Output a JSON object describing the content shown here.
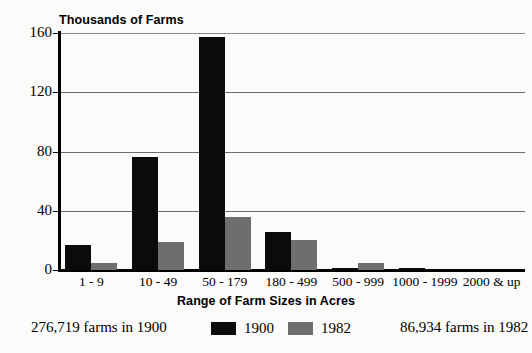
{
  "chart_data": {
    "type": "bar",
    "title": "",
    "ylabel": "Thousands of Farms",
    "xlabel": "Range of Farm Sizes in Acres",
    "categories": [
      "1 - 9",
      "10 - 49",
      "50 - 179",
      "180 - 499",
      "500 - 999",
      "1000 - 1999",
      "2000 & up"
    ],
    "series": [
      {
        "name": "1900",
        "color": "#0b0b0b",
        "values": [
          17,
          76,
          157,
          26,
          1.5,
          1.5,
          0
        ]
      },
      {
        "name": "1982",
        "color": "#6e6e6e",
        "values": [
          5,
          19,
          36,
          20,
          5,
          0,
          0
        ]
      }
    ],
    "ylim": [
      0,
      160
    ],
    "yticks": [
      "0",
      "40",
      "80",
      "120",
      "160"
    ],
    "ytick_values": [
      0,
      40,
      80,
      120,
      160
    ],
    "grid": "horizontal",
    "legend_position": "bottom-center"
  },
  "axes": {
    "y_title": "Thousands of Farms",
    "x_title": "Range of Farm Sizes in Acres"
  },
  "footer": {
    "note_1900": "276,719 farms in 1900",
    "note_1982": "86,934 farms in 1982",
    "legend_1900": "1900",
    "legend_1982": "1982"
  }
}
